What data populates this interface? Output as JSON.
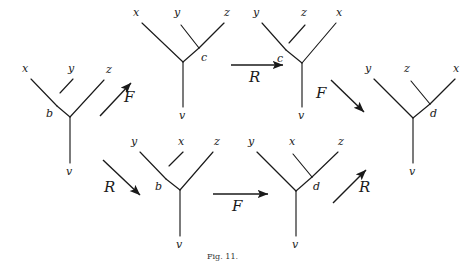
{
  "figure": {
    "caption": "Fig. 11.",
    "stroke_color": "#1a1a1a",
    "background": "#ffffff"
  },
  "trees": [
    {
      "id": "tree-left",
      "leaves": [
        "x",
        "y",
        "z"
      ],
      "internal_label": "b",
      "root_label": "v",
      "shape": "left-branching"
    },
    {
      "id": "tree-top-left",
      "leaves": [
        "x",
        "y",
        "z"
      ],
      "internal_label": "c",
      "root_label": "v",
      "shape": "right-branching"
    },
    {
      "id": "tree-top-middle",
      "leaves": [
        "y",
        "z",
        "x"
      ],
      "internal_label": "c",
      "root_label": "v",
      "shape": "left-branching"
    },
    {
      "id": "tree-right",
      "leaves": [
        "y",
        "z",
        "x"
      ],
      "internal_label": "d",
      "root_label": "v",
      "shape": "right-branching"
    },
    {
      "id": "tree-bottom-left",
      "leaves": [
        "y",
        "x",
        "z"
      ],
      "internal_label": "b",
      "root_label": "v",
      "shape": "left-branching"
    },
    {
      "id": "tree-bottom-middle",
      "leaves": [
        "y",
        "x",
        "z"
      ],
      "internal_label": "d",
      "root_label": "v",
      "shape": "right-branching"
    }
  ],
  "arrows": [
    {
      "id": "arrow-upper-left",
      "label": "F",
      "direction": "up-right"
    },
    {
      "id": "arrow-top",
      "label": "R",
      "direction": "right"
    },
    {
      "id": "arrow-upper-right",
      "label": "F",
      "direction": "down-right"
    },
    {
      "id": "arrow-lower-left",
      "label": "R",
      "direction": "down-right"
    },
    {
      "id": "arrow-bottom",
      "label": "F",
      "direction": "right"
    },
    {
      "id": "arrow-lower-right",
      "label": "R",
      "direction": "up-right"
    }
  ]
}
